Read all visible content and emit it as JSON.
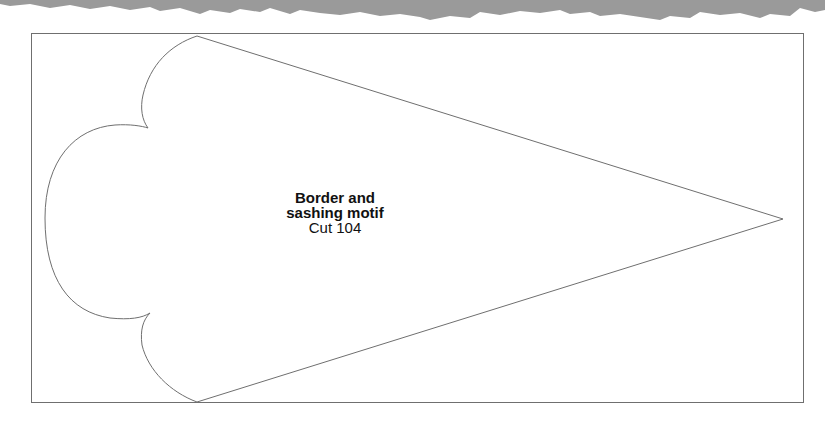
{
  "piece": {
    "title_line1": "Border and",
    "title_line2": "sashing motif",
    "cut_label": "Cut 104"
  },
  "colors": {
    "outline": "#6f6f6f",
    "paper_edge": "#9a9a9a"
  }
}
